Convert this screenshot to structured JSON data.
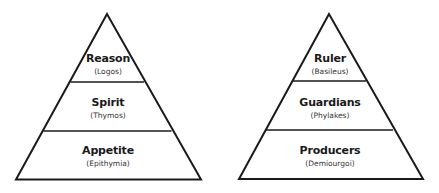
{
  "colors": {
    "stroke": "#1a1a1a",
    "background": "#ffffff",
    "text": "#1a1a1a"
  },
  "pyramids": [
    {
      "name": "soul",
      "tiers": [
        {
          "title": "Reason",
          "subtitle": "(Logos)"
        },
        {
          "title": "Spirit",
          "subtitle": "(Thymos)"
        },
        {
          "title": "Appetite",
          "subtitle": "(Epithymia)"
        }
      ]
    },
    {
      "name": "city",
      "tiers": [
        {
          "title": "Ruler",
          "subtitle": "(Basileus)"
        },
        {
          "title": "Guardians",
          "subtitle": "(Phylakes)"
        },
        {
          "title": "Producers",
          "subtitle": "(Demiourgoi)"
        }
      ]
    }
  ]
}
